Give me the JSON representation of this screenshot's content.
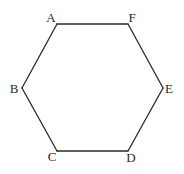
{
  "diagram": {
    "type": "regular-hexagon",
    "stroke_color": "#2a2a2a",
    "background": "#ffffff",
    "vertices": [
      {
        "id": "A",
        "label": "A",
        "x": 57,
        "y": 24,
        "label_x": 51,
        "label_y": 22
      },
      {
        "id": "F",
        "label": "F",
        "x": 128,
        "y": 24,
        "label_x": 132,
        "label_y": 22
      },
      {
        "id": "E",
        "label": "E",
        "x": 163,
        "y": 88,
        "label_x": 169,
        "label_y": 93
      },
      {
        "id": "D",
        "label": "D",
        "x": 128,
        "y": 151,
        "label_x": 131,
        "label_y": 162
      },
      {
        "id": "C",
        "label": "C",
        "x": 57,
        "y": 151,
        "label_x": 52,
        "label_y": 161
      },
      {
        "id": "B",
        "label": "B",
        "x": 22,
        "y": 88,
        "label_x": 14,
        "label_y": 93
      }
    ],
    "edges": [
      [
        "A",
        "F"
      ],
      [
        "F",
        "E"
      ],
      [
        "E",
        "D"
      ],
      [
        "D",
        "C"
      ],
      [
        "C",
        "B"
      ],
      [
        "B",
        "A"
      ]
    ]
  }
}
